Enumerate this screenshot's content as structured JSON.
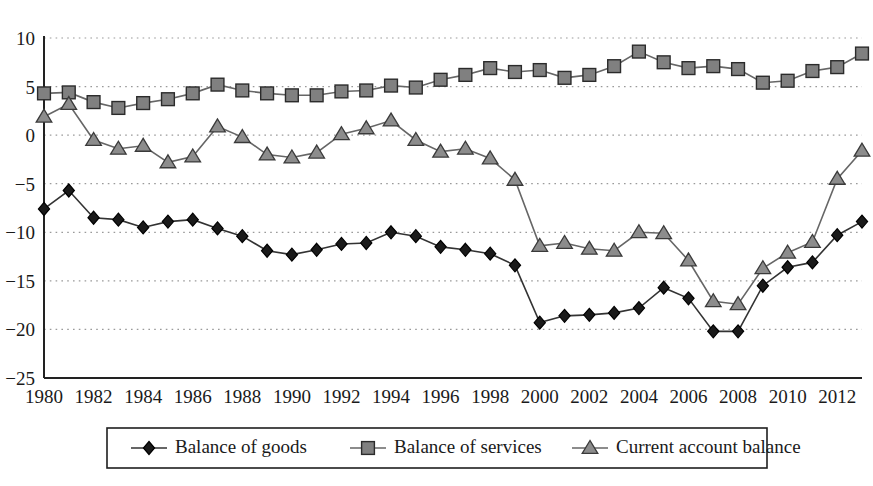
{
  "chart_data": {
    "type": "line",
    "title": "",
    "subtitle": "",
    "xlabel": "",
    "ylabel": "",
    "xlim": [
      1980,
      2013
    ],
    "ylim": [
      -25,
      10
    ],
    "grid": true,
    "legend_position": "bottom",
    "x": [
      1980,
      1981,
      1982,
      1983,
      1984,
      1985,
      1986,
      1987,
      1988,
      1989,
      1990,
      1991,
      1992,
      1993,
      1994,
      1995,
      1996,
      1997,
      1998,
      1999,
      2000,
      2001,
      2002,
      2003,
      2004,
      2005,
      2006,
      2007,
      2008,
      2009,
      2010,
      2011,
      2012,
      2013
    ],
    "x_tick_labels": [
      "1980",
      "1982",
      "1984",
      "1986",
      "1988",
      "1990",
      "1992",
      "1994",
      "1996",
      "1998",
      "2000",
      "2002",
      "2004",
      "2006",
      "2008",
      "2010",
      "2012"
    ],
    "x_tick_values": [
      1980,
      1982,
      1984,
      1986,
      1988,
      1990,
      1992,
      1994,
      1996,
      1998,
      2000,
      2002,
      2004,
      2006,
      2008,
      2010,
      2012
    ],
    "y_tick_labels": [
      "10",
      "5",
      "0",
      "−5",
      "−10",
      "−15",
      "−20",
      "−25"
    ],
    "y_tick_values": [
      10,
      5,
      0,
      -5,
      -10,
      -15,
      -20,
      -25
    ],
    "series": [
      {
        "name": "Balance of goods",
        "marker": "diamond",
        "color": "#1a1a1a",
        "line_color": "#333333",
        "values": [
          -7.6,
          -5.7,
          -8.5,
          -8.7,
          -9.5,
          -8.9,
          -8.7,
          -9.6,
          -10.4,
          -11.9,
          -12.3,
          -11.8,
          -11.2,
          -11.1,
          -10.0,
          -10.4,
          -11.5,
          -11.8,
          -12.2,
          -13.4,
          -19.3,
          -18.6,
          -18.5,
          -18.3,
          -17.8,
          -15.7,
          -16.8,
          -20.2,
          -20.2,
          -15.5,
          -13.6,
          -13.1,
          -10.3,
          -8.9
        ]
      },
      {
        "name": "Balance of services",
        "marker": "square",
        "color": "#808080",
        "line_color": "#666666",
        "values": [
          4.3,
          4.4,
          3.4,
          2.8,
          3.3,
          3.7,
          4.3,
          5.2,
          4.6,
          4.3,
          4.1,
          4.1,
          4.5,
          4.6,
          5.1,
          4.9,
          5.7,
          6.2,
          6.9,
          6.5,
          6.7,
          5.9,
          6.2,
          7.1,
          8.6,
          7.5,
          6.9,
          7.1,
          6.8,
          5.4,
          5.6,
          6.6,
          7.0,
          8.4
        ]
      },
      {
        "name": "Current account balance",
        "marker": "triangle",
        "color": "#8c8c8c",
        "line_color": "#666666",
        "values": [
          1.9,
          3.2,
          -0.5,
          -1.4,
          -1.1,
          -2.8,
          -2.2,
          0.9,
          -0.2,
          -2.0,
          -2.3,
          -1.8,
          0.1,
          0.7,
          1.5,
          -0.5,
          -1.7,
          -1.4,
          -2.4,
          -4.6,
          -11.4,
          -11.1,
          -11.7,
          -11.9,
          -10.0,
          -10.1,
          -12.9,
          -17.1,
          -17.4,
          -13.7,
          -12.1,
          -11.0,
          -4.5,
          -1.6
        ]
      }
    ]
  },
  "legend": {
    "items": [
      {
        "label": "Balance of goods",
        "marker": "diamond"
      },
      {
        "label": "Balance of services",
        "marker": "square"
      },
      {
        "label": "Current account balance",
        "marker": "triangle"
      }
    ]
  }
}
